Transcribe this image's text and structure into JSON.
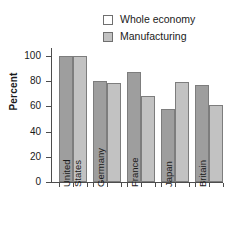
{
  "chart_data": {
    "type": "bar",
    "title": "",
    "subtitle": "",
    "xlabel": "",
    "ylabel": "Percent",
    "ylim": [
      0,
      110
    ],
    "yticks": [
      0,
      20,
      40,
      60,
      80,
      100
    ],
    "grid": false,
    "legend_position": "top-right",
    "categories": [
      "United States",
      "Germany",
      "France",
      "Japan",
      "Britain"
    ],
    "category_lines": [
      [
        "United",
        "States"
      ],
      [
        "Germany"
      ],
      [
        "France"
      ],
      [
        "Japan"
      ],
      [
        "Britain"
      ]
    ],
    "series": [
      {
        "name": "Whole economy",
        "color": "#9e9e9e",
        "values": [
          100,
          80,
          87,
          58,
          77
        ]
      },
      {
        "name": "Manufacturing",
        "color": "#c2c2c2",
        "values": [
          100,
          78.5,
          68,
          79.5,
          61.5
        ]
      }
    ]
  },
  "legend": {
    "items": [
      {
        "label": "Whole economy",
        "swatch": "#9e9e9e"
      },
      {
        "label": "Manufacturing",
        "swatch": "#c2c2c2"
      }
    ]
  },
  "axes": {
    "y_title": "Percent",
    "y_tick_labels": [
      "100",
      "80",
      "60",
      "40",
      "20",
      "0"
    ]
  }
}
